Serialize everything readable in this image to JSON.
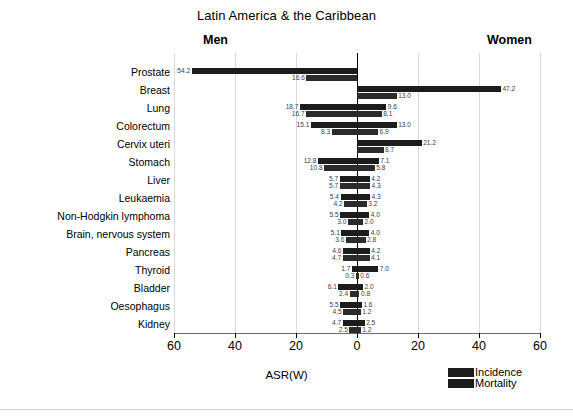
{
  "header": {
    "title": "Latin America & the Caribbean",
    "men_label": "Men",
    "women_label": "Women"
  },
  "axis": {
    "title": "ASR(W)",
    "ticks": [
      "60",
      "40",
      "20",
      "0",
      "20",
      "40",
      "60"
    ]
  },
  "legend": {
    "items": [
      {
        "label": "Incidence",
        "color": "#1c1c1c"
      },
      {
        "label": "Mortality",
        "color": "#2b2b2b"
      }
    ]
  },
  "chart_data": {
    "type": "bar",
    "title": "Latin America & the Caribbean",
    "subtitle": "",
    "xlabel": "ASR(W)",
    "ylabel": "",
    "orientation": "horizontal",
    "layout": "back-to-back population pyramid",
    "left_group": "Men",
    "right_group": "Women",
    "xlim": [
      -60,
      60
    ],
    "xticks": [
      -60,
      -40,
      -20,
      0,
      20,
      40,
      60
    ],
    "xticklabels": [
      "60",
      "40",
      "20",
      "0",
      "20",
      "40",
      "60"
    ],
    "grid": "vertical light gridlines at ticks",
    "legend_position": "bottom-right",
    "series": [
      {
        "name": "Incidence",
        "color": "#1c1c1c"
      },
      {
        "name": "Mortality",
        "color": "#2b2b2b"
      }
    ],
    "categories": [
      "Prostate",
      "Breast",
      "Lung",
      "Colorectum",
      "Cervix uteri",
      "Stomach",
      "Liver",
      "Leukaemia",
      "Non-Hodgkin lymphoma",
      "Brain, nervous system",
      "Pancreas",
      "Thyroid",
      "Bladder",
      "Oesophagus",
      "Kidney"
    ],
    "rows": [
      {
        "category": "Prostate",
        "men_incidence": 54.2,
        "men_mortality": 16.6,
        "women_incidence": null,
        "women_mortality": null
      },
      {
        "category": "Breast",
        "men_incidence": null,
        "men_mortality": null,
        "women_incidence": 47.2,
        "women_mortality": 13.0
      },
      {
        "category": "Lung",
        "men_incidence": 18.7,
        "men_mortality": 16.7,
        "women_incidence": 9.6,
        "women_mortality": 8.1
      },
      {
        "category": "Colorectum",
        "men_incidence": 15.1,
        "men_mortality": 8.3,
        "women_incidence": 13.0,
        "women_mortality": 6.9
      },
      {
        "category": "Cervix uteri",
        "men_incidence": null,
        "men_mortality": null,
        "women_incidence": 21.2,
        "women_mortality": 8.7
      },
      {
        "category": "Stomach",
        "men_incidence": 12.8,
        "men_mortality": 10.8,
        "women_incidence": 7.1,
        "women_mortality": 5.8
      },
      {
        "category": "Liver",
        "men_incidence": 5.7,
        "men_mortality": 5.7,
        "women_incidence": 4.2,
        "women_mortality": 4.3
      },
      {
        "category": "Leukaemia",
        "men_incidence": 5.4,
        "men_mortality": 4.2,
        "women_incidence": 4.3,
        "women_mortality": 3.2
      },
      {
        "category": "Non-Hodgkin lymphoma",
        "men_incidence": 5.5,
        "men_mortality": 3.0,
        "women_incidence": 4.0,
        "women_mortality": 2.0
      },
      {
        "category": "Brain, nervous system",
        "men_incidence": 5.1,
        "men_mortality": 3.6,
        "women_incidence": 4.0,
        "women_mortality": 2.8
      },
      {
        "category": "Pancreas",
        "men_incidence": 4.6,
        "men_mortality": 4.7,
        "women_incidence": 4.2,
        "women_mortality": 4.1
      },
      {
        "category": "Thyroid",
        "men_incidence": 1.7,
        "men_mortality": 0.3,
        "women_incidence": 7.0,
        "women_mortality": 0.6
      },
      {
        "category": "Bladder",
        "men_incidence": 6.1,
        "men_mortality": 2.4,
        "women_incidence": 2.0,
        "women_mortality": 0.8
      },
      {
        "category": "Oesophagus",
        "men_incidence": 5.5,
        "men_mortality": 4.5,
        "women_incidence": 1.6,
        "women_mortality": 1.2
      },
      {
        "category": "Kidney",
        "men_incidence": 4.7,
        "men_mortality": 2.5,
        "women_incidence": 2.5,
        "women_mortality": 1.2
      }
    ]
  }
}
